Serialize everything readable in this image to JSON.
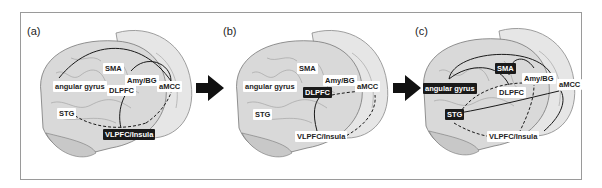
{
  "figure": {
    "panels": [
      {
        "id": "a",
        "label": "(a)",
        "regions": {
          "angular_gyrus": {
            "text": "angular gyrus",
            "highlighted": false
          },
          "sma": {
            "text": "SMA",
            "highlighted": false
          },
          "amy_bg": {
            "text": "Amy/BG",
            "highlighted": false
          },
          "amcc": {
            "text": "aMCC",
            "highlighted": false
          },
          "dlpfc": {
            "text": "DLPFC",
            "highlighted": false
          },
          "stg": {
            "text": "STG",
            "highlighted": false
          },
          "vlpfc_insula": {
            "text": "VLPFC/Insula",
            "highlighted": true
          }
        }
      },
      {
        "id": "b",
        "label": "(b)",
        "regions": {
          "angular_gyrus": {
            "text": "angular gyrus",
            "highlighted": false
          },
          "sma": {
            "text": "SMA",
            "highlighted": false
          },
          "amy_bg": {
            "text": "Amy/BG",
            "highlighted": false
          },
          "amcc": {
            "text": "aMCC",
            "highlighted": false
          },
          "dlpfc": {
            "text": "DLPFC",
            "highlighted": true
          },
          "stg": {
            "text": "STG",
            "highlighted": false
          },
          "vlpfc_insula": {
            "text": "VLPFC/Insula",
            "highlighted": false
          }
        }
      },
      {
        "id": "c",
        "label": "(c)",
        "regions": {
          "angular_gyrus": {
            "text": "angular gyrus",
            "highlighted": true
          },
          "sma": {
            "text": "SMA",
            "highlighted": true
          },
          "amy_bg": {
            "text": "Amy/BG",
            "highlighted": false
          },
          "amcc": {
            "text": "aMCC",
            "highlighted": false
          },
          "dlpfc": {
            "text": "DLPFC",
            "highlighted": false
          },
          "stg": {
            "text": "STG",
            "highlighted": true
          },
          "vlpfc_insula": {
            "text": "VLPFC/Insula",
            "highlighted": false
          }
        }
      }
    ],
    "transition_arrows": [
      "a-to-b",
      "b-to-c"
    ],
    "colors": {
      "brain_fill": "#d9d9d9",
      "brain_sulci": "#9c9c9c",
      "connection": "#1a1a1a",
      "highlight_bg": "#1a1a1a",
      "frame": "#9a9a9a"
    }
  }
}
